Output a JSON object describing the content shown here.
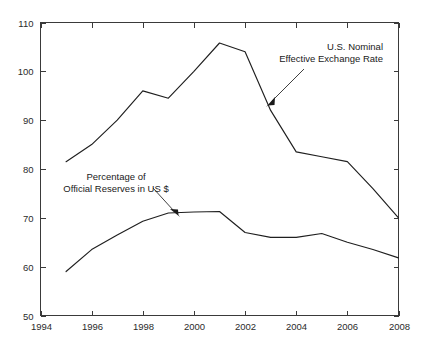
{
  "chart_data": {
    "type": "line",
    "title": "",
    "xlabel": "",
    "ylabel": "",
    "xlim": [
      1994,
      2008
    ],
    "ylim": [
      50,
      110
    ],
    "grid": false,
    "legend_position": "inline-annotations",
    "x": [
      1995,
      1996,
      1997,
      1998,
      1999,
      2000,
      2001,
      2002,
      2003,
      2004,
      2005,
      2006,
      2007,
      2008
    ],
    "xticks": [
      "1994",
      "1996",
      "1998",
      "2000",
      "2002",
      "2004",
      "2006",
      "2008"
    ],
    "xtick_values": [
      1994,
      1996,
      1998,
      2000,
      2002,
      2004,
      2006,
      2008
    ],
    "yticks": [
      "50",
      "60",
      "70",
      "80",
      "90",
      "100",
      "110"
    ],
    "ytick_values": [
      50,
      60,
      70,
      80,
      90,
      100,
      110
    ],
    "series": [
      {
        "name": "U.S. Nominal Effective Exchange Rate",
        "values": [
          81.5,
          85.0,
          90.0,
          96.0,
          94.5,
          100.0,
          105.8,
          104.0,
          92.0,
          83.5,
          82.5,
          81.5,
          76.0,
          70.0
        ]
      },
      {
        "name": "Percentage of Official Reserves in US $",
        "values": [
          59.0,
          63.5,
          66.5,
          69.3,
          71.0,
          71.2,
          71.3,
          67.0,
          66.0,
          66.0,
          66.8,
          65.0,
          63.5,
          61.8
        ]
      }
    ],
    "annotations": [
      {
        "id": "exchange-rate-annotation",
        "lines": [
          "U.S. Nominal",
          "Effective Exchange Rate"
        ],
        "points_to_year": 2003,
        "points_to_value": 92.0
      },
      {
        "id": "reserves-annotation",
        "lines": [
          "Percentage of",
          "Official Reserves in US $"
        ],
        "points_to_year": 1999,
        "points_to_value": 71.0
      }
    ]
  },
  "axis": {
    "y_labels": [
      "110",
      "100",
      "90",
      "80",
      "70",
      "60",
      "50"
    ],
    "x_labels": [
      "1994",
      "1996",
      "1998",
      "2000",
      "2002",
      "2004",
      "2006",
      "2008"
    ]
  },
  "annotations": {
    "exchange_rate": {
      "line1": "U.S. Nominal",
      "line2": "Effective Exchange Rate"
    },
    "reserves": {
      "line1": "Percentage of",
      "line2": "Official Reserves in US $"
    }
  },
  "colors": {
    "background": "#ffffff",
    "line": "#1f1f1f",
    "axis": "#3a3a3a",
    "text": "#1a1a1a"
  }
}
